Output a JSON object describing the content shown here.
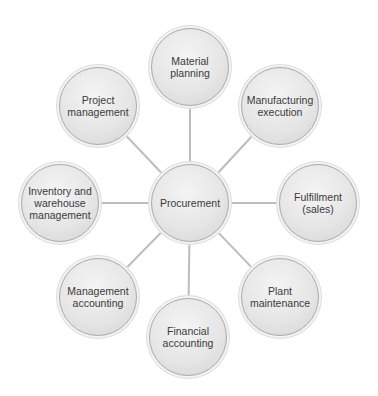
{
  "diagram": {
    "type": "hub-and-spoke",
    "line_color": "#bdbdbd",
    "center": {
      "id": "procurement",
      "label": "Procurement",
      "x": 190,
      "y": 203
    },
    "nodes": [
      {
        "id": "material-planning",
        "label": "Material\nplanning",
        "x": 190,
        "y": 67
      },
      {
        "id": "manufacturing-execution",
        "label": "Manufacturing\nexecution",
        "x": 280,
        "y": 106
      },
      {
        "id": "fulfillment-sales",
        "label": "Fulfillment\n(sales)",
        "x": 318,
        "y": 203
      },
      {
        "id": "plant-maintenance",
        "label": "Plant\nmaintenance",
        "x": 280,
        "y": 297
      },
      {
        "id": "financial-accounting",
        "label": "Financial\naccounting",
        "x": 188,
        "y": 337
      },
      {
        "id": "management-accounting",
        "label": "Management\naccounting",
        "x": 98,
        "y": 297
      },
      {
        "id": "inventory-warehouse-management",
        "label": "Inventory and\nwarehouse\nmanagement",
        "x": 60,
        "y": 203
      },
      {
        "id": "project-management",
        "label": "Project\nmanagement",
        "x": 98,
        "y": 106
      }
    ]
  }
}
